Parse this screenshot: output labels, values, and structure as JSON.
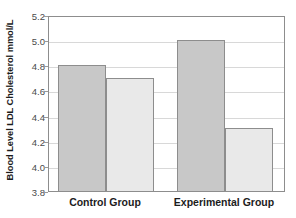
{
  "chart_data": {
    "type": "bar",
    "title": "",
    "xlabel": "",
    "ylabel": "Blood Level LDL Cholesterol mmol/L",
    "categories": [
      "Control Group",
      "Experimental Group"
    ],
    "series": [
      {
        "name": "Before",
        "values": [
          4.8,
          5.0
        ]
      },
      {
        "name": "After",
        "values": [
          4.7,
          4.3
        ]
      }
    ],
    "bars": [
      {
        "group": "Control Group",
        "series": "Before",
        "value": 4.8,
        "color": "#c8c8c8"
      },
      {
        "group": "Control Group",
        "series": "After",
        "value": 4.7,
        "color": "#e9e9e9"
      },
      {
        "group": "Experimental Group",
        "series": "Before",
        "value": 5.0,
        "color": "#c8c8c8"
      },
      {
        "group": "Experimental Group",
        "series": "After",
        "value": 4.3,
        "color": "#e9e9e9"
      }
    ],
    "ylim": [
      3.8,
      5.2
    ],
    "yticks": [
      3.8,
      4.0,
      4.2,
      4.4,
      4.6,
      4.8,
      5.0,
      5.2
    ],
    "ytick_labels": [
      "3.8",
      "4.0",
      "4.2",
      "4.4",
      "4.6",
      "4.8",
      "5.0",
      "5.2"
    ],
    "grid": true,
    "legend": false,
    "legend_position": "none",
    "colors": {
      "bar_dark": "#c8c8c8",
      "bar_light": "#e9e9e9",
      "bar_border": "#8d8d8d",
      "gridline": "#d8d8d8",
      "axis": "#8d8d8d",
      "text": "#1c1c1c",
      "tick_text": "#4a4a4a",
      "background": "#ffffff"
    }
  }
}
